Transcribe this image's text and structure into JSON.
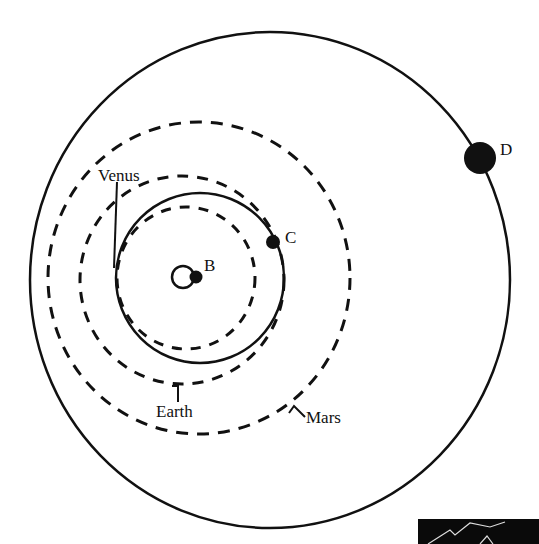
{
  "diagram": {
    "type": "orbital-transfer-diagram",
    "labels": {
      "venus": "Venus",
      "earth": "Earth",
      "mars": "Mars",
      "point_b": "B",
      "point_c": "C",
      "point_d": "D"
    },
    "colors": {
      "line": "#111111",
      "background": "#ffffff"
    }
  }
}
